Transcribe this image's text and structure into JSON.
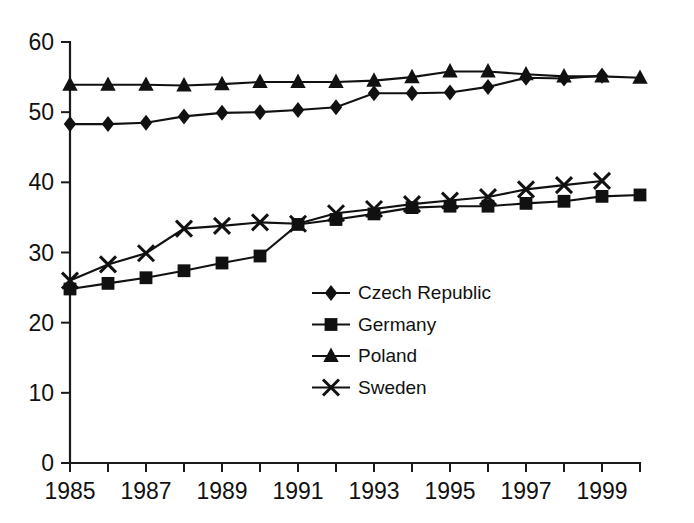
{
  "chart_data": {
    "type": "line",
    "title": "",
    "xlabel": "",
    "ylabel": "",
    "xlim": [
      1985,
      2000
    ],
    "ylim": [
      0,
      60
    ],
    "ytick_values": [
      0,
      10,
      20,
      30,
      40,
      50,
      60
    ],
    "ytick_labels": [
      "0",
      "10",
      "20",
      "30",
      "40",
      "50",
      "60"
    ],
    "xtick_values": [
      1985,
      1986,
      1987,
      1988,
      1989,
      1990,
      1991,
      1992,
      1993,
      1994,
      1995,
      1996,
      1997,
      1998,
      1999,
      2000
    ],
    "xtick_labels": [
      "1985",
      "",
      "1987",
      "",
      "1989",
      "",
      "1991",
      "",
      "1993",
      "",
      "1995",
      "",
      "1997",
      "",
      "1999",
      ""
    ],
    "grid": false,
    "legend_position": "center",
    "series": [
      {
        "name": "Czech Republic",
        "marker": "diamond",
        "color": "#111111",
        "x": [
          1985,
          1986,
          1987,
          1988,
          1989,
          1990,
          1991,
          1992,
          1993,
          1994,
          1995,
          1996,
          1997,
          1998,
          1999
        ],
        "values": [
          48.3,
          48.3,
          48.5,
          49.4,
          49.9,
          50.0,
          50.3,
          50.7,
          52.7,
          52.7,
          52.8,
          53.6,
          54.9,
          54.8,
          55.2
        ]
      },
      {
        "name": "Germany",
        "marker": "square",
        "color": "#111111",
        "x": [
          1985,
          1986,
          1987,
          1988,
          1989,
          1990,
          1991,
          1992,
          1993,
          1994,
          1995,
          1996,
          1997,
          1998,
          1999,
          2000
        ],
        "values": [
          24.8,
          25.6,
          26.4,
          27.4,
          28.5,
          29.5,
          34.0,
          34.7,
          35.5,
          36.4,
          36.6,
          36.6,
          37.0,
          37.3,
          38.0,
          38.2
        ]
      },
      {
        "name": "Poland",
        "marker": "triangle",
        "color": "#111111",
        "x": [
          1985,
          1986,
          1987,
          1988,
          1989,
          1990,
          1991,
          1992,
          1993,
          1994,
          1995,
          1996,
          1997,
          1998,
          1999,
          2000
        ],
        "values": [
          53.9,
          53.9,
          53.9,
          53.8,
          54.0,
          54.3,
          54.3,
          54.3,
          54.5,
          55.0,
          55.8,
          55.8,
          55.4,
          55.1,
          55.1,
          54.9
        ]
      },
      {
        "name": "Sweden",
        "marker": "cross",
        "color": "#111111",
        "x": [
          1985,
          1986,
          1987,
          1988,
          1989,
          1990,
          1991,
          1992,
          1993,
          1994,
          1995,
          1996,
          1997,
          1998,
          1999
        ],
        "values": [
          26.0,
          28.3,
          29.9,
          33.4,
          33.8,
          34.3,
          34.1,
          35.6,
          36.2,
          36.9,
          37.4,
          37.9,
          39.0,
          39.6,
          40.2
        ]
      }
    ]
  },
  "legend": {
    "items": [
      {
        "label": "Czech Republic",
        "marker": "diamond"
      },
      {
        "label": "Germany",
        "marker": "square"
      },
      {
        "label": "Poland",
        "marker": "triangle"
      },
      {
        "label": "Sweden",
        "marker": "cross"
      }
    ]
  }
}
